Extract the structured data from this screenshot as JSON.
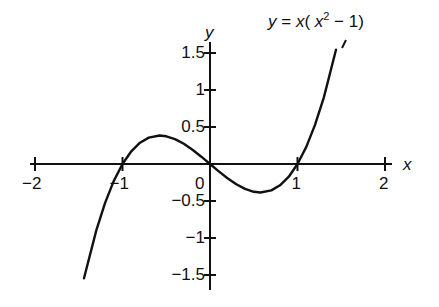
{
  "chart_data": {
    "type": "line",
    "title_parts": {
      "lhs": "y",
      "eq": " = ",
      "x": "x",
      "open": "( ",
      "x2": "x",
      "exp": "2",
      "rest": " − 1)"
    },
    "xlabel": "x",
    "ylabel": "y",
    "xlim": [
      -2,
      2
    ],
    "ylim": [
      -1.5,
      1.5
    ],
    "x_ticks": [
      -2,
      -1,
      0,
      1,
      2
    ],
    "x_tick_labels": [
      "−2",
      "−1",
      "0",
      "1",
      "2"
    ],
    "y_ticks": [
      1.5,
      1,
      0.5,
      -0.5,
      -1,
      -1.5
    ],
    "y_tick_labels": [
      "1.5",
      "1",
      "0.5",
      "−0.5",
      "−1",
      "−1.5"
    ],
    "grid": false,
    "legend": null,
    "series": [
      {
        "name": "y = x(x^2 - 1)",
        "x": [
          -1.44,
          -1.3,
          -1.2,
          -1.1,
          -1.0,
          -0.9,
          -0.8,
          -0.7,
          -0.577,
          -0.5,
          -0.4,
          -0.3,
          -0.2,
          -0.1,
          0,
          0.1,
          0.2,
          0.3,
          0.4,
          0.5,
          0.577,
          0.7,
          0.8,
          0.9,
          1.0,
          1.1,
          1.2,
          1.3,
          1.44
        ],
        "values": [
          -1.545,
          -0.897,
          -0.528,
          -0.231,
          0.0,
          0.171,
          0.288,
          0.357,
          0.385,
          0.375,
          0.336,
          0.273,
          0.192,
          0.099,
          0.0,
          -0.099,
          -0.192,
          -0.273,
          -0.336,
          -0.375,
          -0.385,
          -0.357,
          -0.288,
          -0.171,
          0.0,
          0.231,
          0.528,
          0.897,
          1.545
        ]
      }
    ],
    "annotations": [
      {
        "text": "y = x( x² − 1)",
        "points_to": "curve upper-right branch"
      }
    ]
  }
}
